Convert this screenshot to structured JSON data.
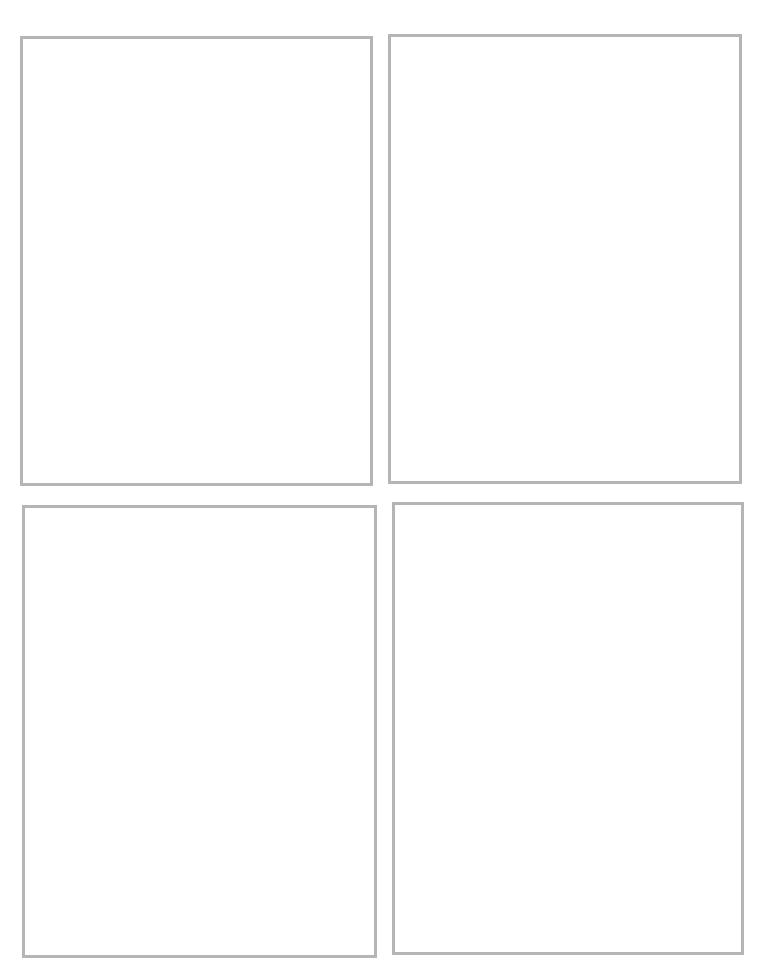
{
  "page": {
    "layout": "2x2 grid of empty comic/storyboard panels",
    "border_color": "#b5b5b5",
    "background_color": "#ffffff"
  },
  "panels": [
    {
      "position": "top-left",
      "content": ""
    },
    {
      "position": "top-right",
      "content": ""
    },
    {
      "position": "bottom-left",
      "content": ""
    },
    {
      "position": "bottom-right",
      "content": ""
    }
  ]
}
